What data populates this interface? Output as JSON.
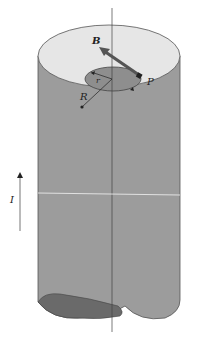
{
  "diagram": {
    "labels": {
      "field": "B",
      "point": "P",
      "inner_radius": "r",
      "outer_radius": "R",
      "current": "I"
    },
    "colors": {
      "cylinder_side": "#9c9c9c",
      "top_face": "#e6e6e6",
      "inner_disk": "#8e8e8e",
      "bottom_face": "#6a6a6a",
      "field_arrow": "#555555",
      "axis_line": "#444444",
      "background": "#ffffff"
    },
    "elements": [
      "cylinder",
      "central-axis",
      "amperian-circle",
      "field-vector-B",
      "point-P",
      "radius-r",
      "radius-R",
      "current-arrow-I"
    ]
  }
}
